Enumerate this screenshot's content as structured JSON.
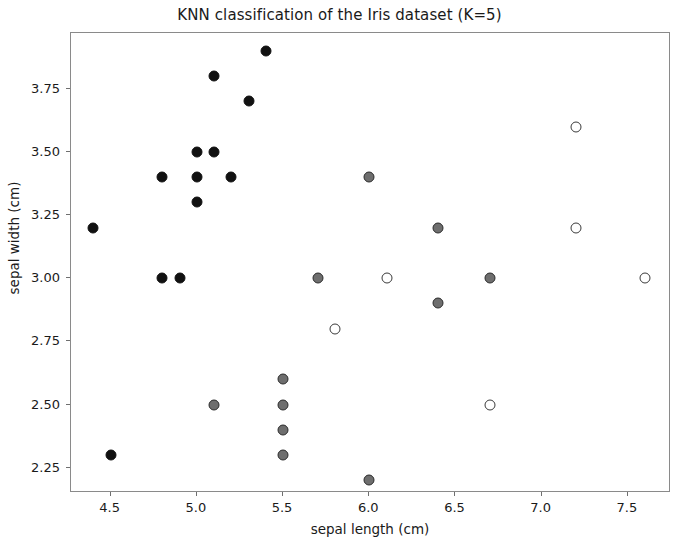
{
  "chart_data": {
    "type": "scatter",
    "title": "KNN classification of the Iris dataset (K=5)",
    "xlabel": "sepal length (cm)",
    "ylabel": "sepal width (cm)",
    "xlim": [
      4.27,
      7.75
    ],
    "ylim": [
      2.15,
      3.97
    ],
    "xticks": [
      4.5,
      5.0,
      5.5,
      6.0,
      6.5,
      7.0,
      7.5
    ],
    "xtick_labels": [
      "4.5",
      "5.0",
      "5.5",
      "6.0",
      "6.5",
      "7.0",
      "7.5"
    ],
    "yticks": [
      2.25,
      2.5,
      2.75,
      3.0,
      3.25,
      3.5,
      3.75
    ],
    "ytick_labels": [
      "2.25",
      "2.50",
      "2.75",
      "3.00",
      "3.25",
      "3.50",
      "3.75"
    ],
    "grid": false,
    "legend": null,
    "marker": "circle",
    "marker_size": 11,
    "series": [
      {
        "name": "class-0",
        "class_index": 0,
        "fill_color": "#111111",
        "edge_color": "#111111",
        "points": [
          [
            4.4,
            3.2
          ],
          [
            4.5,
            2.3
          ],
          [
            4.8,
            3.4
          ],
          [
            4.8,
            3.0
          ],
          [
            4.9,
            3.0
          ],
          [
            5.0,
            3.5
          ],
          [
            5.0,
            3.4
          ],
          [
            5.0,
            3.3
          ],
          [
            5.1,
            3.5
          ],
          [
            5.1,
            3.8
          ],
          [
            5.2,
            3.4
          ],
          [
            5.3,
            3.7
          ],
          [
            5.4,
            3.9
          ]
        ]
      },
      {
        "name": "class-1",
        "class_index": 1,
        "fill_color": "#6e6e6e",
        "edge_color": "#2b2b2b",
        "points": [
          [
            5.1,
            2.5
          ],
          [
            5.5,
            2.6
          ],
          [
            5.5,
            2.5
          ],
          [
            5.5,
            2.4
          ],
          [
            5.5,
            2.3
          ],
          [
            5.7,
            3.0
          ],
          [
            6.0,
            3.4
          ],
          [
            6.0,
            2.2
          ],
          [
            6.4,
            3.2
          ],
          [
            6.4,
            2.9
          ],
          [
            6.7,
            3.0
          ]
        ]
      },
      {
        "name": "class-2",
        "class_index": 2,
        "fill_color": "#ffffff",
        "edge_color": "#3a3a3a",
        "points": [
          [
            5.8,
            2.8
          ],
          [
            6.1,
            3.0
          ],
          [
            6.7,
            2.5
          ],
          [
            7.2,
            3.6
          ],
          [
            7.2,
            3.2
          ],
          [
            7.6,
            3.0
          ]
        ]
      }
    ]
  },
  "figure": {
    "background_color": "#ffffff",
    "axes_edge_color": "#8a8a8a",
    "text_color": "#1a1a1a"
  }
}
